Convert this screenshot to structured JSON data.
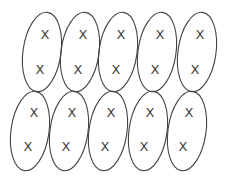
{
  "diagram": {
    "stroke_color": "#444444",
    "background": "#ffffff",
    "rows": [
      {
        "name": "top-row",
        "cells": [
          {
            "cx": 42,
            "cy": 52,
            "rx": 19,
            "ry": 40,
            "tilt": 8,
            "marks": [
              {
                "x": 45,
                "y": 34,
                "label": "X"
              },
              {
                "x": 40,
                "y": 69,
                "label": "X"
              }
            ]
          },
          {
            "cx": 80,
            "cy": 52,
            "rx": 19,
            "ry": 40,
            "tilt": 8,
            "marks": [
              {
                "x": 83,
                "y": 34,
                "label": "X"
              },
              {
                "x": 78,
                "y": 69,
                "label": "X"
              }
            ]
          },
          {
            "cx": 118,
            "cy": 52,
            "rx": 19,
            "ry": 40,
            "tilt": 8,
            "marks": [
              {
                "x": 121,
                "y": 34,
                "label": "X"
              },
              {
                "x": 116,
                "y": 69,
                "label": "X"
              }
            ]
          },
          {
            "cx": 157,
            "cy": 52,
            "rx": 19,
            "ry": 40,
            "tilt": 8,
            "marks": [
              {
                "x": 160,
                "y": 34,
                "label": "X"
              },
              {
                "x": 155,
                "y": 69,
                "label": "X"
              }
            ]
          },
          {
            "cx": 197,
            "cy": 52,
            "rx": 19,
            "ry": 40,
            "tilt": 8,
            "marks": [
              {
                "x": 200,
                "y": 34,
                "label": "X"
              },
              {
                "x": 195,
                "y": 69,
                "label": "X"
              }
            ]
          }
        ]
      },
      {
        "name": "bottom-row",
        "cells": [
          {
            "cx": 30,
            "cy": 131,
            "rx": 19,
            "ry": 40,
            "tilt": 8,
            "marks": [
              {
                "x": 34,
                "y": 112,
                "label": "X"
              },
              {
                "x": 28,
                "y": 146,
                "label": "X"
              }
            ]
          },
          {
            "cx": 69,
            "cy": 131,
            "rx": 19,
            "ry": 40,
            "tilt": 8,
            "marks": [
              {
                "x": 72,
                "y": 112,
                "label": "X"
              },
              {
                "x": 66,
                "y": 146,
                "label": "X"
              }
            ]
          },
          {
            "cx": 108,
            "cy": 131,
            "rx": 19,
            "ry": 40,
            "tilt": 8,
            "marks": [
              {
                "x": 111,
                "y": 112,
                "label": "X"
              },
              {
                "x": 105,
                "y": 146,
                "label": "X"
              }
            ]
          },
          {
            "cx": 148,
            "cy": 131,
            "rx": 19,
            "ry": 40,
            "tilt": 8,
            "marks": [
              {
                "x": 150,
                "y": 112,
                "label": "X"
              },
              {
                "x": 144,
                "y": 146,
                "label": "X"
              }
            ]
          },
          {
            "cx": 187,
            "cy": 131,
            "rx": 19,
            "ry": 40,
            "tilt": 8,
            "marks": [
              {
                "x": 189,
                "y": 112,
                "label": "X"
              },
              {
                "x": 183,
                "y": 146,
                "label": "X"
              }
            ]
          }
        ]
      }
    ]
  }
}
